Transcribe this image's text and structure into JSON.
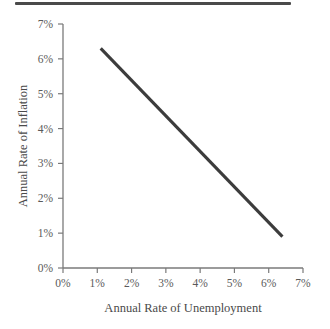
{
  "figure": {
    "top_rule_name": "horizontal-rule",
    "background_color": "#ffffff"
  },
  "chart_data": {
    "type": "line",
    "title": "",
    "subtitle": "",
    "xlabel": "Annual Rate of Unemployment",
    "ylabel": "Annual Rate of Inflation",
    "xlim": [
      0,
      7
    ],
    "ylim": [
      0,
      7
    ],
    "grid": false,
    "legend": false,
    "legend_position": "none",
    "line_color": "#3c3c3c",
    "axis_color": "#7a7a7a",
    "label_color": "#5a5a5a",
    "x_ticks": [
      0,
      1,
      2,
      3,
      4,
      5,
      6,
      7
    ],
    "y_ticks": [
      0,
      1,
      2,
      3,
      4,
      5,
      6,
      7
    ],
    "x_tick_labels": [
      "0%",
      "1%",
      "2%",
      "3%",
      "4%",
      "5%",
      "6%",
      "7%"
    ],
    "y_tick_labels": [
      "0%",
      "1%",
      "2%",
      "3%",
      "4%",
      "5%",
      "6%",
      "7%"
    ],
    "series": [
      {
        "name": "Phillips curve",
        "x": [
          1.1,
          6.4
        ],
        "values": [
          6.3,
          0.9
        ]
      }
    ],
    "annotations": []
  }
}
